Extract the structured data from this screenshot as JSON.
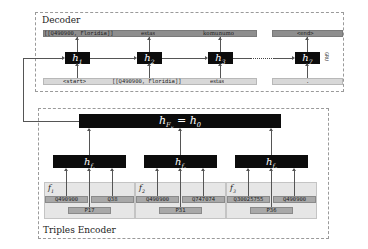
{
  "decoder": {
    "title": "Decoder",
    "cell_type": "GRU",
    "outputs": [
      {
        "text": "[[Q490900, Floridia]]",
        "pos": 0
      },
      {
        "text": "estas",
        "pos": 1
      },
      {
        "text": "komunumo",
        "pos": 2
      },
      {
        "text": "<end>",
        "pos": 3
      }
    ],
    "inputs": [
      {
        "text": "<start>",
        "pos": 0
      },
      {
        "text": "[[Q490900, Floridia]]",
        "pos": 1
      },
      {
        "text": "estas",
        "pos": 2
      },
      {
        "text": ".",
        "pos": 3
      }
    ],
    "hidden_states": [
      "h",
      "h",
      "h",
      "h"
    ],
    "hidden_subscripts": [
      "1",
      "2",
      "3",
      "7"
    ],
    "ellipsis": "......."
  },
  "encoder": {
    "title": "Triples Encoder",
    "top_state": {
      "base": "h",
      "sub": "F",
      "subsub": "E",
      "rhs": "= h",
      "rhs_sub": "0"
    },
    "fact_states": [
      {
        "base": "h",
        "sub": "f",
        "subsub": "1"
      },
      {
        "base": "h",
        "sub": "f",
        "subsub": "2"
      },
      {
        "base": "h",
        "sub": "f",
        "subsub": "3"
      }
    ],
    "facts": [
      {
        "label": "f",
        "label_sub": "1",
        "subject": "Q490900",
        "object": "Q38",
        "property": "P17"
      },
      {
        "label": "f",
        "label_sub": "2",
        "subject": "Q490900",
        "object": "Q747074",
        "property": "P31"
      },
      {
        "label": "f",
        "label_sub": "3",
        "subject": "Q30025755",
        "object": "Q490900",
        "property": "P36"
      }
    ]
  },
  "colors": {
    "state_box": "#0c0c0c",
    "output_bar": "#8e8e8e",
    "input_bar": "#d8d8d8",
    "fact_panel": "#e6e6e6",
    "fact_cell": "#a8a8a8",
    "dashed_border": "#9a9a9a"
  }
}
